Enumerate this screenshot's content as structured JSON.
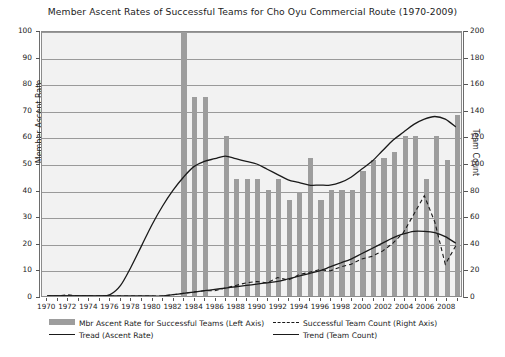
{
  "chart_data": {
    "type": "bar",
    "title": "Member Ascent Rates of Successful Teams for Cho Oyu Commercial Route (1970-2009)",
    "xlabel": "",
    "ylabel": "Member Ascent Rate",
    "ylabel_right": "Team Count",
    "ylim": [
      0,
      100
    ],
    "ylim_right": [
      0,
      200
    ],
    "yticks": [
      0,
      10,
      20,
      30,
      40,
      50,
      60,
      70,
      80,
      90,
      100
    ],
    "yticks_right": [
      0,
      20,
      40,
      60,
      80,
      100,
      120,
      140,
      160,
      180,
      200
    ],
    "xticks": [
      1970,
      1972,
      1974,
      1976,
      1978,
      1980,
      1982,
      1984,
      1986,
      1988,
      1990,
      1992,
      1994,
      1996,
      1998,
      2000,
      2002,
      2004,
      2006,
      2008
    ],
    "x": [
      1970,
      1971,
      1972,
      1973,
      1974,
      1975,
      1976,
      1977,
      1978,
      1979,
      1980,
      1981,
      1982,
      1983,
      1984,
      1985,
      1986,
      1987,
      1988,
      1989,
      1990,
      1991,
      1992,
      1993,
      1994,
      1995,
      1996,
      1997,
      1998,
      1999,
      2000,
      2001,
      2002,
      2003,
      2004,
      2005,
      2006,
      2007,
      2008,
      2009
    ],
    "grid": true,
    "legend_position": "below",
    "series": [
      {
        "name": "Mbr Ascent Rate for Successful Teams (Left Axis)",
        "type": "bar",
        "axis": "left",
        "color": "#9d9d9d",
        "values": [
          0,
          0,
          0,
          0,
          0,
          0,
          0,
          0,
          0,
          0,
          0,
          0,
          0,
          100,
          75,
          75,
          0,
          60,
          44,
          44,
          44,
          40,
          44,
          36,
          39,
          52,
          36,
          40,
          40,
          40,
          47,
          51,
          52,
          54,
          60,
          60,
          44,
          60,
          51,
          68
        ]
      },
      {
        "name": "Tread (Ascent Rate)",
        "type": "line",
        "axis": "left",
        "color": "#1a1a1a",
        "style": "solid",
        "values": [
          0,
          0,
          0,
          0,
          0,
          0,
          0.5,
          4,
          11,
          19,
          27,
          34,
          40,
          45,
          49,
          51,
          52,
          53,
          52,
          51,
          50,
          48,
          46,
          44,
          43,
          42,
          42,
          42,
          43,
          45,
          48,
          51,
          55,
          59,
          62,
          65,
          67,
          68,
          67,
          64
        ]
      },
      {
        "name": "Successful Team Count (Right Axis)",
        "type": "line",
        "axis": "right",
        "color": "#1a1a1a",
        "style": "dashed",
        "values": [
          0,
          0,
          1,
          0,
          0,
          0,
          0,
          0,
          0,
          0,
          0,
          0,
          1,
          2,
          3,
          4,
          4,
          6,
          8,
          10,
          11,
          10,
          14,
          12,
          16,
          18,
          20,
          19,
          22,
          24,
          28,
          30,
          34,
          40,
          48,
          62,
          76,
          56,
          24,
          38
        ]
      },
      {
        "name": "Trend (Team Count)",
        "type": "line",
        "axis": "right",
        "color": "#1a1a1a",
        "style": "solid",
        "values": [
          0,
          0,
          0,
          0,
          0,
          0,
          0,
          0,
          0,
          0,
          0,
          0,
          1,
          2,
          3,
          4,
          5,
          6,
          7,
          8,
          9,
          10,
          11,
          13,
          15,
          17,
          19,
          22,
          25,
          28,
          32,
          36,
          40,
          44,
          47,
          49,
          49,
          48,
          45,
          40
        ]
      }
    ]
  },
  "legend": {
    "items": [
      {
        "label": "Mbr Ascent Rate for Successful Teams (Left Axis)",
        "marker": "bar-swatch-icon"
      },
      {
        "label": "Tread (Ascent Rate)",
        "marker": "solid-line-icon"
      },
      {
        "label": "Successful Team Count (Right Axis)",
        "marker": "dashed-line-icon"
      },
      {
        "label": "Trend (Team Count)",
        "marker": "solid-line-icon"
      }
    ]
  },
  "caption": "",
  "colors": {
    "bar": "#9d9d9d",
    "line": "#1a1a1a",
    "plot_bg": "#f2f2f2",
    "grid": "#9a9a9a"
  }
}
